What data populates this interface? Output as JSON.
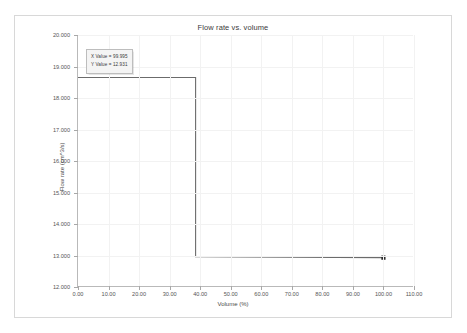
{
  "chart_data": {
    "type": "line",
    "title": "Flow rate vs. volume",
    "xlabel": "Volume (%)",
    "ylabel": "Flow rate (cm^3/s)",
    "xlim": [
      0,
      110
    ],
    "ylim": [
      12.0,
      20.0
    ],
    "grid": true,
    "legend": "none",
    "x_ticks": [
      "0.00",
      "10.00",
      "20.00",
      "30.00",
      "40.00",
      "50.00",
      "60.00",
      "70.00",
      "80.00",
      "90.00",
      "100.00",
      "110.00"
    ],
    "x_tick_values": [
      0,
      10,
      20,
      30,
      40,
      50,
      60,
      70,
      80,
      90,
      100,
      110
    ],
    "y_ticks": [
      "12.000",
      "13.000",
      "14.000",
      "15.000",
      "16.000",
      "17.000",
      "18.000",
      "19.000",
      "20.000"
    ],
    "y_tick_values": [
      12,
      13,
      14,
      15,
      16,
      17,
      18,
      19,
      20
    ],
    "series": [
      {
        "name": "Flow rate",
        "color": "#6b6b6b",
        "x": [
          0.0,
          38.5,
          38.5,
          99.995
        ],
        "y": [
          18.65,
          18.65,
          12.96,
          12.931
        ],
        "marker_points": [
          {
            "x": 99.995,
            "y": 12.931,
            "shape": "square",
            "color": "#2b2b2b"
          }
        ]
      }
    ],
    "annotations": [
      {
        "name": "data-tip",
        "x_line": "X Value = 99.995",
        "y_line": "Y Value = 12.931"
      }
    ]
  }
}
